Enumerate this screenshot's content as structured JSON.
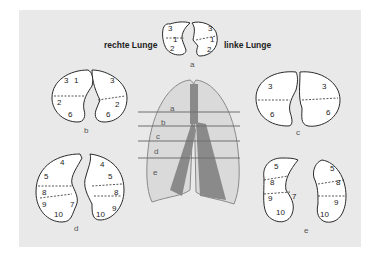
{
  "labels": {
    "right_lung": "rechte Lunge",
    "left_lung": "linke Lunge"
  },
  "sections": [
    {
      "id": "a",
      "label": "a",
      "right_segments": [
        "3",
        "1",
        "2"
      ],
      "left_segments": [
        "3",
        "1",
        "2"
      ]
    },
    {
      "id": "b",
      "label": "b",
      "right_segments": [
        "3",
        "1",
        "2",
        "6"
      ],
      "left_segments": [
        "3",
        "2",
        "6"
      ]
    },
    {
      "id": "c",
      "label": "c",
      "right_segments": [
        "3",
        "6"
      ],
      "left_segments": [
        "3",
        "6"
      ]
    },
    {
      "id": "d",
      "label": "d",
      "right_segments": [
        "4",
        "5",
        "8",
        "9",
        "7",
        "10"
      ],
      "left_segments": [
        "4",
        "5",
        "8",
        "9",
        "10"
      ]
    },
    {
      "id": "e",
      "label": "e",
      "right_segments": [
        "5",
        "8",
        "9",
        "7",
        "10"
      ],
      "left_segments": [
        "5",
        "8",
        "9",
        "10"
      ]
    }
  ],
  "center_diagram": {
    "level_labels": [
      "a",
      "b",
      "c",
      "d",
      "e"
    ],
    "line_color": "#6f6f6f",
    "lung_color": "#8a8a8a"
  },
  "colors": {
    "background": "#e9e9e9",
    "outline": "#2a2a2a",
    "fill": "#ffffff"
  }
}
